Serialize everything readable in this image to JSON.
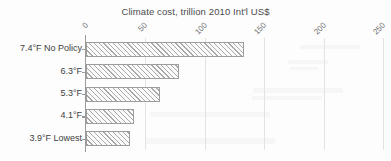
{
  "chart_data": {
    "type": "bar",
    "orientation": "horizontal",
    "title": "Climate cost, trillion 2010 Int'l US$",
    "xlabel": "",
    "ylabel": "",
    "categories": [
      "7.4°F No Policy",
      "6.3°F",
      "5.3°F",
      "4.1°F",
      "3.9°F Lowest"
    ],
    "values": [
      133,
      78,
      62,
      40,
      37
    ],
    "xlim": [
      0,
      250
    ],
    "xticks": [
      0,
      50,
      100,
      150,
      200,
      250
    ],
    "xtick_labels": [
      "0",
      "50",
      "100",
      "150",
      "200",
      "250"
    ],
    "xtick_rotation": -45,
    "grid": true,
    "grid_axis": "x",
    "legend": null,
    "bar_fill": "hatched-diagonal",
    "bar_edge_color": "#9d9d9d",
    "bar_hatch_color": "#a9a9a9",
    "grid_color": "#e3e3e3",
    "axis_color": "#9a9a9a",
    "text_color": "#3d3d3d",
    "background": "#fdfdfd"
  }
}
